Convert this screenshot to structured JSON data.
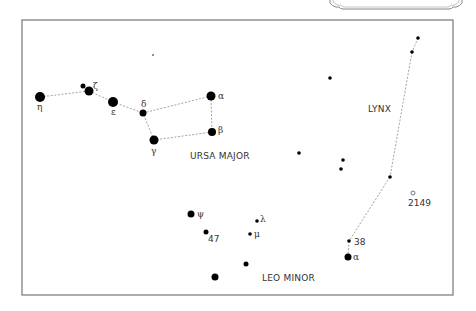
{
  "chart_data": {
    "type": "star_chart",
    "title": "",
    "constellations": [
      {
        "name": "URSA MAJOR",
        "label_pos": [
          190,
          159
        ]
      },
      {
        "name": "LYNX",
        "label_pos": [
          368,
          112
        ]
      },
      {
        "name": "LEO MINOR",
        "label_pos": [
          262,
          281
        ]
      }
    ],
    "stars": [
      {
        "id": "uma-eta",
        "label": "η",
        "x": 40,
        "y": 97,
        "r": 5,
        "lx": 37,
        "ly": 110
      },
      {
        "id": "uma-zeta",
        "label": "ζ",
        "x": 89,
        "y": 91,
        "r": 4.5,
        "lx": 93,
        "ly": 89
      },
      {
        "id": "uma-80",
        "label": "",
        "x": 83,
        "y": 86,
        "r": 2.5
      },
      {
        "id": "uma-epsilon",
        "label": "ε",
        "x": 113,
        "y": 102,
        "r": 5,
        "lx": 111,
        "ly": 115
      },
      {
        "id": "uma-delta",
        "label": "δ",
        "x": 143,
        "y": 113,
        "r": 3.5,
        "lx": 141,
        "ly": 107
      },
      {
        "id": "uma-gamma",
        "label": "γ",
        "x": 154,
        "y": 140,
        "r": 4.5,
        "lx": 151,
        "ly": 154
      },
      {
        "id": "uma-alpha",
        "label": "α",
        "x": 211,
        "y": 96,
        "r": 4.5,
        "lx": 218,
        "ly": 99
      },
      {
        "id": "uma-beta",
        "label": "β",
        "x": 212,
        "y": 132,
        "r": 4,
        "lx": 218,
        "ly": 133
      },
      {
        "id": "field-1",
        "label": "",
        "x": 153,
        "y": 55,
        "r": 0.8
      },
      {
        "id": "lyn-1",
        "label": "",
        "x": 418,
        "y": 38,
        "r": 1.8
      },
      {
        "id": "lyn-2",
        "label": "",
        "x": 412,
        "y": 52,
        "r": 1.8
      },
      {
        "id": "lyn-3",
        "label": "",
        "x": 390,
        "y": 177,
        "r": 1.8
      },
      {
        "id": "lyn-38",
        "label": "38",
        "x": 349,
        "y": 241,
        "r": 1.8,
        "lx": 354,
        "ly": 245
      },
      {
        "id": "lyn-alpha",
        "label": "α",
        "x": 348,
        "y": 257,
        "r": 3.5,
        "lx": 353,
        "ly": 260
      },
      {
        "id": "lyn-field-a",
        "label": "",
        "x": 330,
        "y": 78,
        "r": 1.8
      },
      {
        "id": "field-b",
        "label": "",
        "x": 299,
        "y": 153,
        "r": 1.8
      },
      {
        "id": "field-c",
        "label": "",
        "x": 343,
        "y": 160,
        "r": 1.8
      },
      {
        "id": "field-d",
        "label": "",
        "x": 341,
        "y": 169,
        "r": 1.8
      },
      {
        "id": "ngc-2149",
        "label": "2149",
        "x": 413,
        "y": 193,
        "r": 2,
        "open": true,
        "lx": 408,
        "ly": 206
      },
      {
        "id": "lmi-psi",
        "label": "ψ",
        "x": 191,
        "y": 214,
        "r": 3.5,
        "lx": 197,
        "ly": 217
      },
      {
        "id": "lmi-47",
        "label": "47",
        "x": 206,
        "y": 232,
        "r": 2.5,
        "lx": 208,
        "ly": 242
      },
      {
        "id": "lmi-lambda",
        "label": "λ",
        "x": 257,
        "y": 221,
        "r": 1.8,
        "lx": 260,
        "ly": 222
      },
      {
        "id": "lmi-mu",
        "label": "μ",
        "x": 250,
        "y": 234,
        "r": 1.8,
        "lx": 254,
        "ly": 237
      },
      {
        "id": "lmi-46",
        "label": "",
        "x": 246,
        "y": 264,
        "r": 2.5
      },
      {
        "id": "lmi-big",
        "label": "",
        "x": 215,
        "y": 277,
        "r": 3.5
      }
    ],
    "lines": [
      {
        "from": "uma-eta",
        "to": "uma-zeta"
      },
      {
        "from": "uma-zeta",
        "to": "uma-epsilon"
      },
      {
        "from": "uma-epsilon",
        "to": "uma-delta"
      },
      {
        "from": "uma-delta",
        "to": "uma-alpha"
      },
      {
        "from": "uma-alpha",
        "to": "uma-beta"
      },
      {
        "from": "uma-beta",
        "to": "uma-gamma"
      },
      {
        "from": "uma-gamma",
        "to": "uma-delta"
      },
      {
        "from": "lyn-1",
        "to": "lyn-2"
      },
      {
        "from": "lyn-2",
        "to": "lyn-3"
      },
      {
        "from": "lyn-3",
        "to": "lyn-38"
      },
      {
        "from": "lyn-38",
        "to": "lyn-alpha"
      }
    ],
    "frame": {
      "x": 22,
      "y": 20,
      "w": 431,
      "h": 275
    }
  }
}
